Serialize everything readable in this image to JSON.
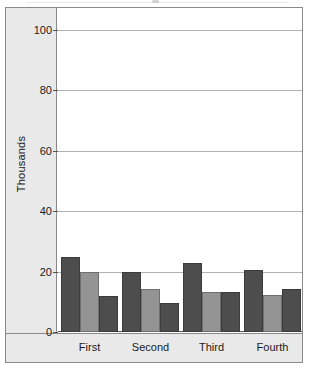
{
  "chart_data": {
    "type": "bar",
    "title": "",
    "subtitle": "",
    "xlabel": "",
    "ylabel": "Thousands",
    "categories": [
      "First",
      "Second",
      "Third",
      "Fourth"
    ],
    "series": [
      {
        "name": "Series 1",
        "color": "#4d4d4d",
        "values": [
          25.0,
          20.0,
          22.8,
          20.5
        ]
      },
      {
        "name": "Series 2",
        "color": "#949494",
        "values": [
          19.8,
          14.3,
          13.3,
          12.3
        ]
      },
      {
        "name": "Series 3",
        "color": "#4d4d4d",
        "values": [
          11.8,
          9.5,
          13.3,
          14.2
        ]
      }
    ],
    "ylim": [
      0,
      100
    ],
    "yticks": [
      0,
      20,
      40,
      60,
      80,
      100
    ],
    "ytick_labels": [
      "0",
      "20",
      "40",
      "60",
      "80",
      "100"
    ],
    "grid": true,
    "grid_axis": "y",
    "legend": false,
    "legend_position": "none",
    "bar_gap_within_group": 0,
    "annotations": []
  },
  "style": {
    "plot_background": "#ffffff",
    "panel_background": "#e9e9e9",
    "frame_color": "#8a8a8a",
    "gridline_color": "#b3b3b3",
    "axis_color": "#555555",
    "text_color": "#1a1a1a"
  }
}
